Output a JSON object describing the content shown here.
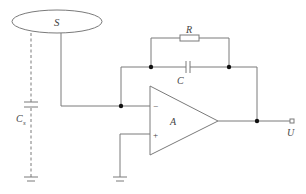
{
  "diagram": {
    "type": "circuit-schematic",
    "colors": {
      "wire": "#7a7a7a",
      "node": "#111111",
      "text": "#444444",
      "background": "#ffffff"
    },
    "labels": {
      "electrode": "S",
      "resistor": "R",
      "capacitor": "C",
      "stray_capacitor": "C",
      "stray_capacitor_sub": "s",
      "amplifier": "A",
      "inverting_input": "−",
      "noninverting_input": "+",
      "output": "U"
    },
    "components": [
      {
        "id": "S",
        "kind": "electrode-ellipse"
      },
      {
        "id": "Cs",
        "kind": "capacitor",
        "style": "dashed",
        "to": "ground"
      },
      {
        "id": "R",
        "kind": "resistor",
        "position": "feedback"
      },
      {
        "id": "C",
        "kind": "capacitor",
        "position": "feedback"
      },
      {
        "id": "A",
        "kind": "op-amp"
      },
      {
        "id": "U",
        "kind": "output-terminal"
      }
    ]
  }
}
